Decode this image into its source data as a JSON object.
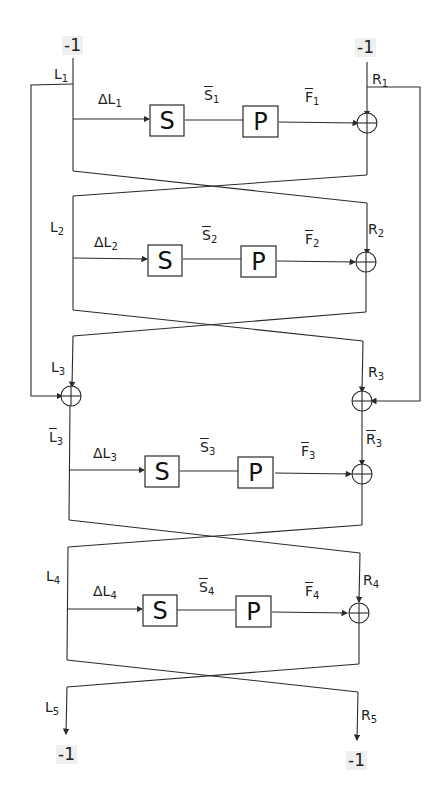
{
  "diagram": {
    "type": "feistel-network",
    "rounds": 4,
    "inputs": {
      "left": "-1",
      "right": "-1"
    },
    "outputs": {
      "left": "-1",
      "right": "-1"
    },
    "colors": {
      "stroke": "#2a2a2a",
      "background": "#ffffff",
      "label_bg": "#efefef"
    },
    "rounds_data": [
      {
        "L": "L",
        "Li": "1",
        "R": "R",
        "Ri": "1",
        "dL": "ΔL",
        "S": "S",
        "Sbar": "S",
        "P": "P",
        "Fbar": "F",
        "idx": "1"
      },
      {
        "L": "L",
        "Li": "2",
        "R": "R",
        "Ri": "2",
        "dL": "ΔL",
        "S": "S",
        "Sbar": "S",
        "P": "P",
        "Fbar": "F",
        "idx": "2"
      },
      {
        "L": "L",
        "Li": "3",
        "R": "R",
        "Ri": "3",
        "dL": "ΔL",
        "S": "S",
        "Sbar": "S",
        "P": "P",
        "Fbar": "F",
        "idx": "3"
      },
      {
        "L": "L",
        "Li": "4",
        "R": "R",
        "Ri": "4",
        "dL": "ΔL",
        "S": "S",
        "Sbar": "S",
        "P": "P",
        "Fbar": "F",
        "idx": "4"
      }
    ],
    "extra_labels": {
      "L3bar": "L",
      "L3bar_i": "3",
      "R3bar": "R",
      "R3bar_i": "3",
      "L5": "L",
      "L5_i": "5",
      "R5": "R",
      "R5_i": "5"
    },
    "edges": [
      "L1 -> ΔL1 -> S -> S̄1 -> P -> F̄1 -> XOR(R1)",
      "L1 -> feedback loop (left) -> XOR with L3 -> L̄3",
      "R1 -> feedback loop (right) -> XOR with R3 -> R̄3",
      "swap after each round",
      "L5 -> -1, R5 -> -1"
    ]
  }
}
